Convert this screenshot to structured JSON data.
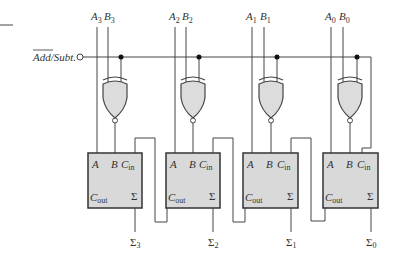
{
  "control": {
    "label": "Add/Subt.",
    "overbar_part": "Add",
    "rest_part": "/Subt."
  },
  "stages": [
    {
      "index": 3,
      "a_label": "A",
      "a_sub": "3",
      "b_label": "B",
      "b_sub": "3",
      "out_label": "Σ",
      "out_sub": "3"
    },
    {
      "index": 2,
      "a_label": "A",
      "a_sub": "2",
      "b_label": "B",
      "b_sub": "2",
      "out_label": "Σ",
      "out_sub": "2"
    },
    {
      "index": 1,
      "a_label": "A",
      "a_sub": "1",
      "b_label": "B",
      "b_sub": "1",
      "out_label": "Σ",
      "out_sub": "1"
    },
    {
      "index": 0,
      "a_label": "A",
      "a_sub": "0",
      "b_label": "B",
      "b_sub": "0",
      "out_label": "Σ",
      "out_sub": "0"
    }
  ],
  "adder_block": {
    "in_a": "A",
    "in_b": "B",
    "cin": "C",
    "cin_sub": "in",
    "cout": "C",
    "cout_sub": "out",
    "sum": "Σ"
  },
  "colors": {
    "line": "#444444",
    "gate_fill": "#dcdcdc",
    "block_fill": "#d9d9d9",
    "block_border": "#333333",
    "text": "#333333"
  }
}
